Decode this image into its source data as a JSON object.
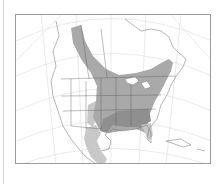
{
  "map": {
    "region": "North America",
    "projection": "conic with graticule",
    "legend": [],
    "range_shades": {
      "light": "#c8c8c8",
      "medium": "#a9a9a9",
      "dark": "#8f8f8f"
    },
    "colors": {
      "background": "#ffffff",
      "frame": "#9a9a9a",
      "graticule": "#dcdcdc",
      "borders": "#555555"
    }
  }
}
